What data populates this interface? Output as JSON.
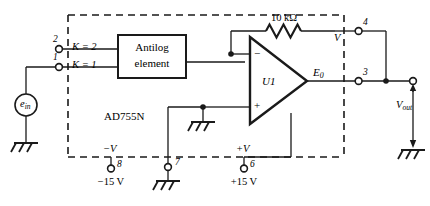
{
  "diagram": {
    "title_block": {
      "chip_label": "AD755N"
    },
    "input_source": {
      "name": "e_in",
      "symbol_text": "e",
      "symbol_sub": "in"
    },
    "pins": [
      {
        "number": "2",
        "signal": "K = 2"
      },
      {
        "number": "1",
        "signal": "K = 1"
      },
      {
        "number": "4",
        "signal": "V"
      },
      {
        "number": "3",
        "signal": "E_0"
      },
      {
        "number": "8",
        "signal": "-V",
        "supply": "−15 V"
      },
      {
        "number": "7",
        "signal": "",
        "supply": ""
      },
      {
        "number": "6",
        "signal": "+V",
        "supply": "+15 V"
      }
    ],
    "pin_labels": {
      "p2": "2",
      "p1": "1",
      "p4": "4",
      "p3": "3",
      "p8": "8",
      "p7": "7",
      "p6": "6"
    },
    "gain_labels": {
      "k2": "K = 2",
      "k1": "K = 1"
    },
    "block": {
      "line1": "Antilog",
      "line2": "element"
    },
    "opamp": {
      "designator": "U1",
      "inverting_input": "−",
      "noninverting_input": "+",
      "output_label_main": "E",
      "output_label_sub": "0"
    },
    "resistor": {
      "value": "10 kΩ"
    },
    "supplies": {
      "neg_rail_label": "−V",
      "pos_rail_label": "+V",
      "neg_value": "−15 V",
      "pos_value": "+15 V"
    },
    "output": {
      "label_main": "V",
      "label_sub": "out"
    },
    "colors": {
      "wire": "#1a1a1a",
      "dashed_boundary": "#1a1a1a",
      "text": "#000000",
      "background": "#ffffff"
    }
  }
}
